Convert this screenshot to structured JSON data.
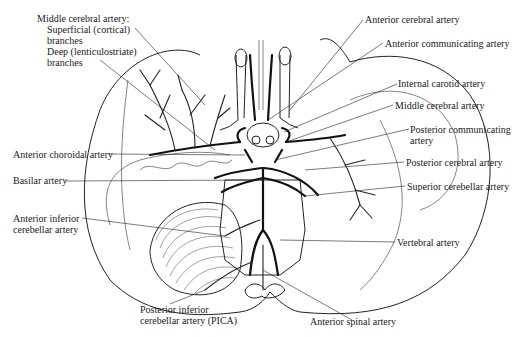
{
  "diagram": {
    "type": "anatomical line drawing",
    "labels": {
      "mca_group": {
        "heading": "Middle cerebral artery:",
        "superficial_line1": "Superficial (cortical)",
        "superficial_line2": "branches",
        "deep_line1": "Deep (lenticulostriate)",
        "deep_line2": "branches"
      },
      "anterior_cerebral": "Anterior cerebral artery",
      "anterior_communicating": "Anterior communicating artery",
      "internal_carotid": "Internal carotid artery",
      "middle_cerebral": "Middle cerebral artery",
      "posterior_communicating_line1": "Posterior communicating",
      "posterior_communicating_line2": "artery",
      "anterior_choroidal": "Anterior choroidal artery",
      "posterior_cerebral": "Posterior cerebral artery",
      "basilar": "Basilar artery",
      "superior_cerebellar": "Superior cerebellar artery",
      "aica_line1": "Anterior inferior",
      "aica_line2": "cerebellar artery",
      "vertebral": "Vertebral artery",
      "pica_line1": "Posterior inferior",
      "pica_line2": "cerebellar artery (PICA)",
      "anterior_spinal": "Anterior spinal artery"
    }
  }
}
